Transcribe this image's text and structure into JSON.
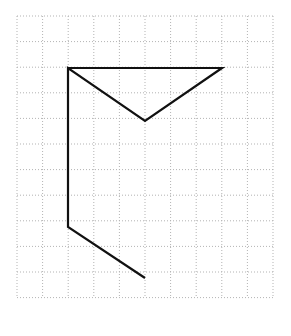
{
  "page": {
    "background_color": "#ffffff",
    "width": 291,
    "height": 336
  },
  "grid": {
    "name": "dotted-square-grid",
    "origin_x": 17,
    "origin_y": 16,
    "cell_size": 25.6,
    "columns": 10,
    "rows": 11,
    "line_color": "#b3b3b3",
    "line_width": 1,
    "dash_pattern": "1,2",
    "x_lines": [
      17,
      42.6,
      68.2,
      93.8,
      119.4,
      145,
      170.6,
      196.2,
      221.8,
      247.4,
      273
    ],
    "y_lines": [
      16,
      41.6,
      67.2,
      92.8,
      118.4,
      144,
      169.6,
      195.2,
      220.8,
      246.4,
      272,
      297.6
    ]
  },
  "figure": {
    "name": "polyline-figure",
    "stroke_color": "#111111",
    "stroke_width": 2.2,
    "fill": "none",
    "vertices_px": [
      {
        "label": "A",
        "x": 68,
        "y": 68,
        "grid_col": 2,
        "grid_row": 2
      },
      {
        "label": "B",
        "x": 222,
        "y": 68,
        "grid_col": 8,
        "grid_row": 2
      },
      {
        "label": "C",
        "x": 145,
        "y": 121,
        "grid_col": 5,
        "grid_row": 4
      },
      {
        "label": "D",
        "x": 68,
        "y": 68,
        "grid_col": 2,
        "grid_row": 2
      },
      {
        "label": "E",
        "x": 68,
        "y": 227,
        "grid_col": 2,
        "grid_row": 8
      },
      {
        "label": "F",
        "x": 145,
        "y": 278,
        "grid_col": 5,
        "grid_row": 10
      }
    ],
    "segments": [
      {
        "name": "top-horizontal-edge",
        "from": "A",
        "to": "B"
      },
      {
        "name": "right-diagonal-edge",
        "from": "B",
        "to": "C"
      },
      {
        "name": "left-diagonal-edge",
        "from": "C",
        "to": "D"
      },
      {
        "name": "long-vertical-edge",
        "from": "A",
        "to": "E"
      },
      {
        "name": "bottom-diagonal-tail",
        "from": "E",
        "to": "F"
      }
    ],
    "path_d": "M 68 68 L 222 68 L 145 121 L 68 68 L 68 227 L 145 278"
  }
}
